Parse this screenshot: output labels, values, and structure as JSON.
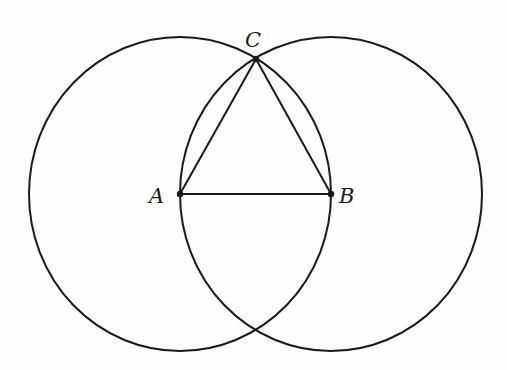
{
  "diagram": {
    "title": "",
    "points": {
      "A": {
        "label": "A",
        "x": 180,
        "y": 194
      },
      "B": {
        "label": "B",
        "x": 331,
        "y": 194
      },
      "C": {
        "label": "C",
        "x": 256,
        "y": 59
      }
    },
    "circles": [
      {
        "center": "A",
        "rx": 151,
        "ry": 157
      },
      {
        "center": "B",
        "rx": 151,
        "ry": 157
      }
    ],
    "segments": [
      [
        "A",
        "B"
      ],
      [
        "A",
        "C"
      ],
      [
        "B",
        "C"
      ]
    ],
    "stroke_color": "#1a1a1a"
  }
}
